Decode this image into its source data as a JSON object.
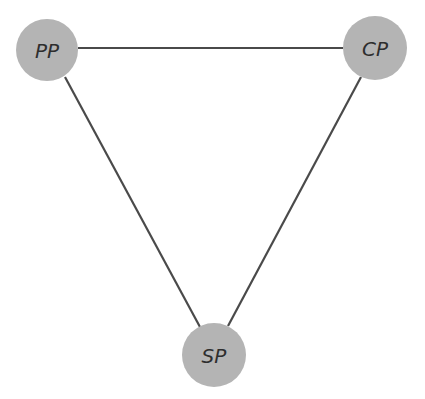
{
  "diagram": {
    "type": "triangle-graph",
    "colors": {
      "node_fill": "#b4b4b4",
      "edge": "#4a4a4a",
      "label": "#2e2e2e",
      "background": "#ffffff"
    },
    "nodes": [
      {
        "id": "PP",
        "label": "PP",
        "cx": 47,
        "cy": 50,
        "r": 31
      },
      {
        "id": "CP",
        "label": "CP",
        "cx": 375,
        "cy": 48,
        "r": 32
      },
      {
        "id": "SP",
        "label": "SP",
        "cx": 214,
        "cy": 355,
        "r": 32
      }
    ],
    "edges": [
      {
        "from": "PP",
        "to": "CP"
      },
      {
        "from": "PP",
        "to": "SP"
      },
      {
        "from": "CP",
        "to": "SP"
      }
    ]
  }
}
